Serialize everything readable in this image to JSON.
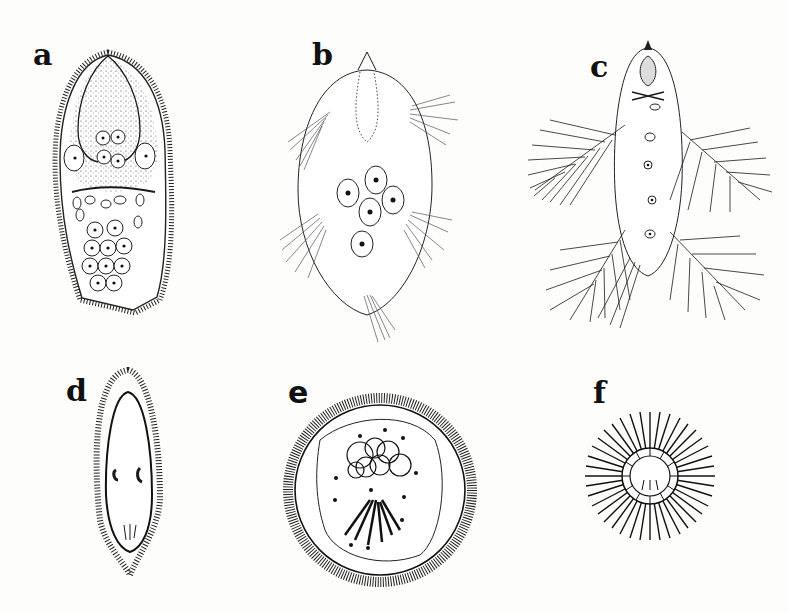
{
  "figure": {
    "background": "#fdfdfc",
    "ink_color": "#1a1a1a",
    "panels": [
      {
        "id": "a",
        "label": "a",
        "description": "Elongate ciliate with dense surface cilia, stippled anterior cytoplasm, two large lateral nuclei, central nuclei and cluster of nucleated cells in posterior"
      },
      {
        "id": "b",
        "label": "b",
        "description": "Oval cell with apical cone, dotted anterior vesicle, five nuclei, four lateral tufts of cilia and posterior tuft"
      },
      {
        "id": "c",
        "label": "c",
        "description": "Elongate cell with apical pear-shaped structure, row of nuclei and four large feather-like ciliary fans"
      },
      {
        "id": "d",
        "label": "d",
        "description": "Slender elongate ciliate with fringe of cilia, two curved nuclei and posterior structures"
      },
      {
        "id": "e",
        "label": "e",
        "description": "Spherical cyst-like cell with ciliated rim, cluster of overlapping circles and dark fibrous bundle"
      },
      {
        "id": "f",
        "label": "f",
        "description": "Small sphere surrounded by dense radiating spines with segmented inner ring"
      }
    ]
  }
}
